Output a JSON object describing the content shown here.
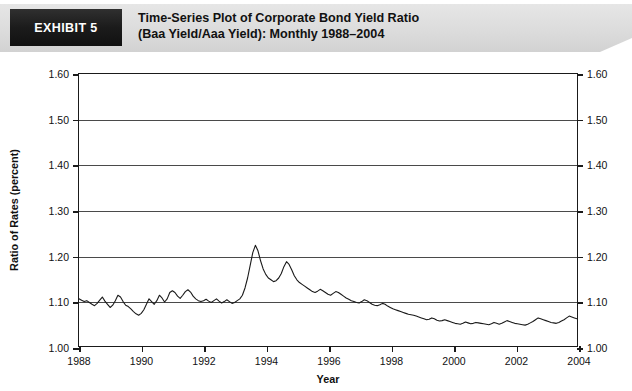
{
  "header": {
    "exhibit_tag": "EXHIBIT 5",
    "title_line1": "Time-Series Plot of Corporate Bond Yield Ratio",
    "title_line2": "(Baa Yield/Aaa Yield): Monthly 1988–2004",
    "tag_bg": "#1b1b1b",
    "tag_text_color": "#ffffff",
    "banner_bg": "#dcdcdc"
  },
  "chart_data": {
    "type": "line",
    "title": "Time-Series Plot of Corporate Bond Yield Ratio (Baa Yield/Aaa Yield): Monthly 1988–2004",
    "xlabel": "Year",
    "ylabel": "Ratio of Rates (percent)",
    "xlim": [
      1988,
      2004
    ],
    "ylim": [
      1.0,
      1.6
    ],
    "grid": true,
    "legend": null,
    "line_color": "#1a1a1a",
    "x_ticks": [
      1988,
      1990,
      1992,
      1994,
      1996,
      1998,
      2000,
      2002,
      2004
    ],
    "x_tick_labels": [
      "1988",
      "1990",
      "1992",
      "1994",
      "1996",
      "1998",
      "2000",
      "2002",
      "2004"
    ],
    "y_ticks": [
      1.0,
      1.1,
      1.2,
      1.3,
      1.4,
      1.5,
      1.6
    ],
    "y_tick_labels": [
      "1.00",
      "1.10",
      "1.20",
      "1.30",
      "1.40",
      "1.50",
      "1.60"
    ],
    "y_axis_right_labels": [
      "1.00",
      "1.10",
      "1.20",
      "1.30",
      "1.40",
      "1.50",
      "1.60"
    ],
    "series": [
      {
        "name": "Baa/Aaa Yield Ratio",
        "x_start": 1988.0,
        "x_step": 0.0833333,
        "values": [
          1.104,
          1.101,
          1.098,
          1.1,
          1.096,
          1.092,
          1.089,
          1.094,
          1.101,
          1.108,
          1.099,
          1.092,
          1.085,
          1.09,
          1.1,
          1.112,
          1.108,
          1.098,
          1.09,
          1.087,
          1.082,
          1.076,
          1.071,
          1.068,
          1.072,
          1.08,
          1.092,
          1.104,
          1.098,
          1.092,
          1.1,
          1.112,
          1.106,
          1.097,
          1.104,
          1.118,
          1.122,
          1.118,
          1.11,
          1.105,
          1.112,
          1.12,
          1.124,
          1.119,
          1.11,
          1.104,
          1.1,
          1.098,
          1.1,
          1.103,
          1.099,
          1.096,
          1.1,
          1.104,
          1.099,
          1.095,
          1.098,
          1.102,
          1.098,
          1.094,
          1.096,
          1.1,
          1.104,
          1.112,
          1.128,
          1.15,
          1.178,
          1.206,
          1.222,
          1.21,
          1.188,
          1.17,
          1.158,
          1.15,
          1.146,
          1.142,
          1.144,
          1.15,
          1.16,
          1.175,
          1.186,
          1.18,
          1.168,
          1.155,
          1.146,
          1.14,
          1.136,
          1.132,
          1.128,
          1.124,
          1.12,
          1.118,
          1.121,
          1.125,
          1.122,
          1.118,
          1.114,
          1.112,
          1.116,
          1.12,
          1.118,
          1.114,
          1.11,
          1.106,
          1.103,
          1.1,
          1.098,
          1.096,
          1.095,
          1.098,
          1.102,
          1.1,
          1.096,
          1.092,
          1.09,
          1.089,
          1.091,
          1.094,
          1.092,
          1.088,
          1.085,
          1.082,
          1.08,
          1.078,
          1.076,
          1.074,
          1.072,
          1.07,
          1.069,
          1.068,
          1.066,
          1.064,
          1.062,
          1.06,
          1.058,
          1.059,
          1.062,
          1.06,
          1.057,
          1.055,
          1.056,
          1.058,
          1.056,
          1.054,
          1.052,
          1.05,
          1.049,
          1.048,
          1.05,
          1.053,
          1.051,
          1.049,
          1.05,
          1.052,
          1.051,
          1.05,
          1.049,
          1.048,
          1.047,
          1.049,
          1.052,
          1.05,
          1.048,
          1.05,
          1.053,
          1.056,
          1.054,
          1.052,
          1.05,
          1.049,
          1.048,
          1.047,
          1.046,
          1.048,
          1.051,
          1.054,
          1.058,
          1.062,
          1.06,
          1.058,
          1.056,
          1.054,
          1.052,
          1.051,
          1.05,
          1.052,
          1.055,
          1.058,
          1.062,
          1.066,
          1.064,
          1.062,
          1.06,
          1.059,
          1.058,
          1.06,
          1.064,
          1.07,
          1.078,
          1.092,
          1.112,
          1.138,
          1.158,
          1.166,
          1.16,
          1.152,
          1.158,
          1.15,
          1.14,
          1.128,
          1.116,
          1.108,
          1.102,
          1.098,
          1.096,
          1.094,
          1.096,
          1.1,
          1.104,
          1.102,
          1.098,
          1.094,
          1.092,
          1.09,
          1.092,
          1.096,
          1.1,
          1.104,
          1.1,
          1.094,
          1.09,
          1.088,
          1.09,
          1.094,
          1.1,
          1.108,
          1.116,
          1.122,
          1.118,
          1.116,
          1.122,
          1.13,
          1.142,
          1.158,
          1.176,
          1.192,
          1.206,
          1.218,
          1.224,
          1.23,
          1.236,
          1.242,
          1.248,
          1.252,
          1.256,
          1.254,
          1.25,
          1.246,
          1.252,
          1.262,
          1.27,
          1.268,
          1.262,
          1.258,
          1.254,
          1.25,
          1.248,
          1.252,
          1.266,
          1.29,
          1.32,
          1.36,
          1.41,
          1.46,
          1.484,
          1.44,
          1.4,
          1.38,
          1.37,
          1.374,
          1.382,
          1.378,
          1.37,
          1.362,
          1.352,
          1.366,
          1.396,
          1.336,
          1.404,
          1.33,
          1.386,
          1.348,
          1.41,
          1.468,
          1.51,
          1.534,
          1.546,
          1.52,
          1.47,
          1.428,
          1.402,
          1.412,
          1.396,
          1.41,
          1.384,
          1.404,
          1.4,
          1.396,
          1.386,
          1.376,
          1.372,
          1.37,
          1.368,
          1.366,
          1.352,
          1.326,
          1.3,
          1.286,
          1.298,
          1.282,
          1.252,
          1.228,
          1.214,
          1.212,
          1.218,
          1.228,
          1.238,
          1.244,
          1.24,
          1.234,
          1.23,
          1.228,
          1.232,
          1.236,
          1.234,
          1.232
        ]
      }
    ],
    "annotations": {
      "peak_1990": 1.222,
      "peak_1991": 1.186,
      "peak_1998": 1.166,
      "peak_2001": 1.484,
      "peak_2002": 1.546,
      "trough_1996": 1.046,
      "end_2004": 1.232
    }
  }
}
